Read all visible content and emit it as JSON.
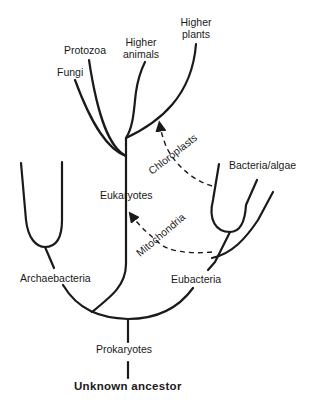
{
  "diagram": {
    "type": "phylogenetic-tree",
    "colors": {
      "line": "#1a1a1a",
      "background": "#ffffff"
    },
    "labels": {
      "higher_plants_1": "Higher",
      "higher_plants_2": "plants",
      "higher_animals_1": "Higher",
      "higher_animals_2": "animals",
      "protozoa": "Protozoa",
      "fungi": "Fungi",
      "eukaryotes": "Eukaryotes",
      "chloroplasts": "Chloroplasts",
      "bacteria_algae": "Bacteria/algae",
      "mitochondria": "Mitochondria",
      "archaebacteria": "Archaebacteria",
      "eubacteria": "Eubacteria",
      "prokaryotes": "Prokaryotes",
      "unknown_ancestor": "Unknown ancestor"
    },
    "nodes": [
      {
        "id": "unknown_ancestor",
        "label": "Unknown ancestor"
      },
      {
        "id": "prokaryotes",
        "label": "Prokaryotes",
        "parent": "unknown_ancestor"
      },
      {
        "id": "archaebacteria",
        "label": "Archaebacteria",
        "parent": "prokaryotes"
      },
      {
        "id": "eukaryotes",
        "label": "Eukaryotes",
        "parent": "prokaryotes"
      },
      {
        "id": "eubacteria",
        "label": "Eubacteria",
        "parent": "prokaryotes"
      },
      {
        "id": "fungi",
        "label": "Fungi",
        "parent": "eukaryotes"
      },
      {
        "id": "protozoa",
        "label": "Protozoa",
        "parent": "eukaryotes"
      },
      {
        "id": "higher_animals",
        "label": "Higher animals",
        "parent": "eukaryotes"
      },
      {
        "id": "higher_plants",
        "label": "Higher plants",
        "parent": "eukaryotes"
      },
      {
        "id": "bacteria_algae",
        "label": "Bacteria/algae",
        "parent": "eubacteria"
      }
    ],
    "endosymbiosis_arrows": [
      {
        "label": "Chloroplasts",
        "from": "bacteria_algae",
        "to": "higher_plants",
        "style": "dashed"
      },
      {
        "label": "Mitochondria",
        "from": "eubacteria",
        "to": "eukaryotes",
        "style": "dashed"
      }
    ]
  }
}
